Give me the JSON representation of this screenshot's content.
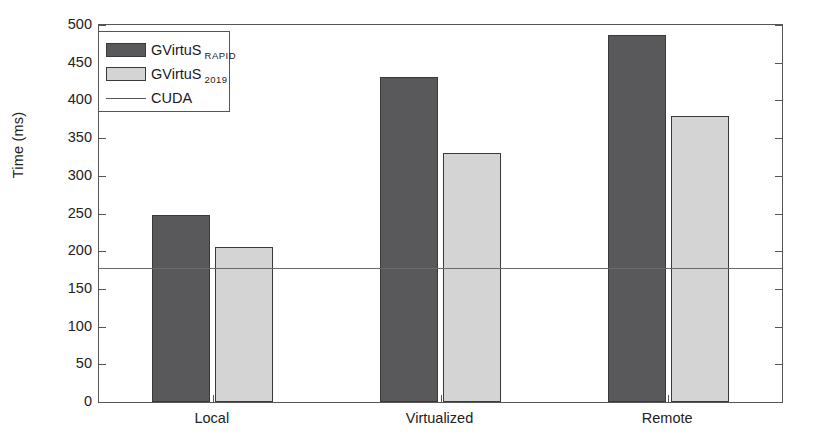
{
  "chart_data": {
    "type": "bar",
    "title": "",
    "subtitle": "",
    "xlabel": "",
    "ylabel": "Time (ms)",
    "categories": [
      "Local",
      "Virtualized",
      "Remote"
    ],
    "series": [
      {
        "name": "GVirtuS RAPID",
        "name_main": "GVirtuS",
        "name_sub": "RAPID",
        "color": "#59595b",
        "values": [
          248,
          431,
          487
        ]
      },
      {
        "name": "GVirtuS 2019",
        "name_main": "GVirtuS",
        "name_sub": "2019",
        "color": "#d4d4d4",
        "values": [
          205,
          330,
          379
        ]
      }
    ],
    "reference_line": {
      "name": "CUDA",
      "value": 178,
      "color": "#6a6a6a"
    },
    "ylim": [
      0,
      500
    ],
    "ytick_values": [
      0,
      50,
      100,
      150,
      200,
      250,
      300,
      350,
      400,
      450,
      500
    ],
    "ytick_labels": [
      "0",
      "50",
      "100",
      "150",
      "200",
      "250",
      "300",
      "350",
      "400",
      "450",
      "500"
    ],
    "grid": false,
    "legend_position": "upper left",
    "legend_entries": [
      "GVirtuS RAPID",
      "GVirtuS 2019",
      "CUDA"
    ]
  },
  "legend": {
    "rows": [
      {
        "label_main": "GVirtuS",
        "label_sub": "RAPID",
        "kind": "swatch"
      },
      {
        "label_main": "GVirtuS",
        "label_sub": "2019",
        "kind": "swatch"
      },
      {
        "label_main": "CUDA",
        "label_sub": "",
        "kind": "line"
      }
    ]
  },
  "colors": {
    "bar_dark": "#59595b",
    "bar_light": "#d4d4d4",
    "axis": "#555555",
    "reference_line": "#6a6a6a",
    "background": "#ffffff"
  }
}
